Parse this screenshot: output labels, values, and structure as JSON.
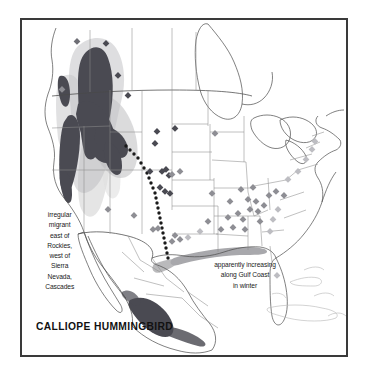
{
  "map": {
    "title": "CALLIOPE HUMMINGBIRD",
    "frame_color": "#3a3a3a",
    "background_color": "#ffffff",
    "annotations": [
      {
        "name": "west-migration-note",
        "text": "irregular\nmigrant\neast of\nRockies,\nwest of\nSierra\nNevada,\nCascades"
      },
      {
        "name": "gulf-coast-note",
        "text": "apparently increasing\nalong Gulf Coast\nin winter"
      }
    ],
    "legend_colors": {
      "breeding_range": "#4a4a52",
      "breeding_halo": "#b9b9bd",
      "migration_shading": "#dcdcdc",
      "winter_range": "#4a4a52",
      "gulf_winter_strip": "#9a9a9e",
      "record_marker_dark": "#4a4a52",
      "record_marker_mid": "#8e8e94",
      "record_marker_light": "#bdbdc2",
      "coastline": "#4a4a4a",
      "state_border": "#8c8c8c",
      "migration_route_dots": "#1a1a1a"
    },
    "ranges": {
      "breeding": "Pacific Northwest / northern Rockies: British Columbia, Washington, Idaho, western Montana, south into Nevada and the Sierra Nevada of California",
      "winter": "western and southern Mexico highlands and Pacific slope",
      "gulf_winter": "narrow strip along the northern Gulf Coast from Texas to Florida panhandle"
    },
    "markers": {
      "label": "scattered migration/vagrant records",
      "description": "diamond symbols marking out-of-range records across the Great Plains, Southeast and Atlantic coast"
    }
  }
}
